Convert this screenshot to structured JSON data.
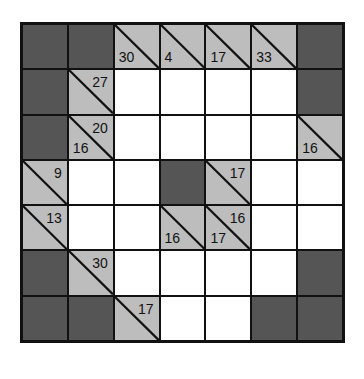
{
  "puzzle": {
    "type": "kakuro",
    "rows": 7,
    "cols": 7,
    "colors": {
      "black": "#555555",
      "clue": "#bdbdbd",
      "white": "#ffffff",
      "line": "#111111"
    },
    "grid": [
      [
        {
          "t": "black"
        },
        {
          "t": "black"
        },
        {
          "t": "clue",
          "down": "30"
        },
        {
          "t": "clue",
          "down": "4"
        },
        {
          "t": "clue",
          "down": "17"
        },
        {
          "t": "clue",
          "down": "33"
        },
        {
          "t": "black"
        }
      ],
      [
        {
          "t": "black"
        },
        {
          "t": "clue",
          "across": "27"
        },
        {
          "t": "white"
        },
        {
          "t": "white"
        },
        {
          "t": "white"
        },
        {
          "t": "white"
        },
        {
          "t": "black"
        }
      ],
      [
        {
          "t": "black"
        },
        {
          "t": "clue",
          "down": "16",
          "across": "20"
        },
        {
          "t": "white"
        },
        {
          "t": "white"
        },
        {
          "t": "white"
        },
        {
          "t": "white"
        },
        {
          "t": "clue",
          "down": "16"
        }
      ],
      [
        {
          "t": "clue",
          "across": "9"
        },
        {
          "t": "white"
        },
        {
          "t": "white"
        },
        {
          "t": "black"
        },
        {
          "t": "clue",
          "across": "17"
        },
        {
          "t": "white"
        },
        {
          "t": "white"
        }
      ],
      [
        {
          "t": "clue",
          "across": "13"
        },
        {
          "t": "white"
        },
        {
          "t": "white"
        },
        {
          "t": "clue",
          "down": "16"
        },
        {
          "t": "clue",
          "down": "17",
          "across": "16"
        },
        {
          "t": "white"
        },
        {
          "t": "white"
        }
      ],
      [
        {
          "t": "black"
        },
        {
          "t": "clue",
          "across": "30"
        },
        {
          "t": "white"
        },
        {
          "t": "white"
        },
        {
          "t": "white"
        },
        {
          "t": "white"
        },
        {
          "t": "black"
        }
      ],
      [
        {
          "t": "black"
        },
        {
          "t": "black"
        },
        {
          "t": "clue",
          "across": "17"
        },
        {
          "t": "white"
        },
        {
          "t": "white"
        },
        {
          "t": "black"
        },
        {
          "t": "black"
        }
      ]
    ]
  }
}
